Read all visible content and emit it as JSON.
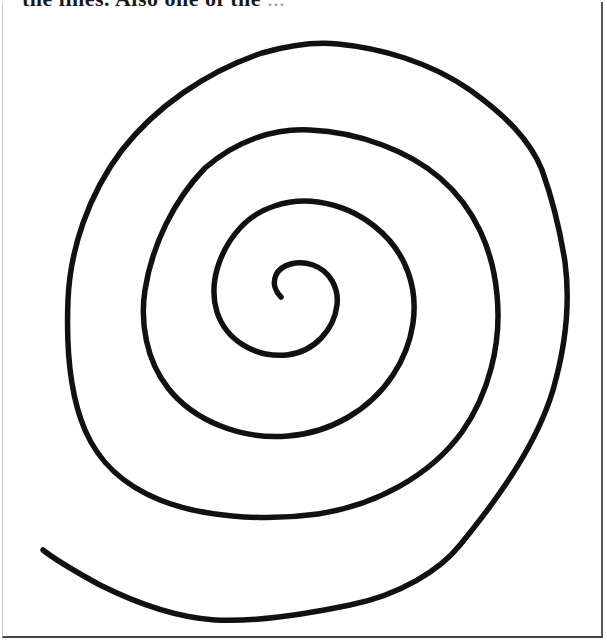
{
  "caption": {
    "text_bold": "the lines. Also one of the",
    "text_faded": "...",
    "truncated": true
  },
  "figure": {
    "type": "hand-drawn spiral",
    "stroke_color": "#111111",
    "background_color": "#ffffff",
    "border_color": "#444444",
    "turns": 4,
    "center": [
      280,
      298
    ],
    "outer_end": [
      43,
      550
    ]
  }
}
